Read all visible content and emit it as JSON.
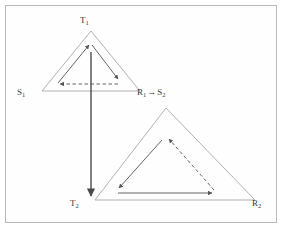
{
  "figure": {
    "type": "geometry-diagram",
    "background_color": "#ffffff",
    "frame_color": "#b9b9b9",
    "stroke_color": "#9a9a9a",
    "arrow_color": "#555555",
    "vertical_arrow_color": "#4a4a4a",
    "label_color": "#3a3a3a"
  },
  "labels": {
    "t1": "T",
    "t1_sub": "1",
    "s1": "S",
    "s1_sub": "1",
    "r1": "R",
    "r1_sub": "1",
    "map_arrow": "→",
    "s2": "S",
    "s2_sub": "2",
    "t2": "T",
    "t2_sub": "2",
    "r2": "R",
    "r2_sub": "2"
  },
  "triangles": [
    {
      "name": "triangle-one",
      "vertices": {
        "apex": {
          "label": "T1",
          "x": 91,
          "y": 31
        },
        "left": {
          "label": "S1",
          "x": 42,
          "y": 91
        },
        "right": {
          "label": "R1",
          "x": 140,
          "y": 91
        }
      },
      "inner_cycle": [
        {
          "style": "solid",
          "from": "left",
          "to": "apex",
          "direction": "up-right"
        },
        {
          "style": "solid",
          "from": "apex",
          "to": "right",
          "direction": "down-right"
        },
        {
          "style": "dashed",
          "from": "right",
          "to": "left",
          "direction": "left"
        }
      ]
    },
    {
      "name": "triangle-two",
      "vertices": {
        "apex": {
          "label": "S2",
          "x": 166,
          "y": 108
        },
        "left": {
          "label": "T2",
          "x": 95,
          "y": 200
        },
        "right": {
          "label": "R2",
          "x": 255,
          "y": 200
        }
      },
      "inner_cycle": [
        {
          "style": "solid",
          "from": "apex",
          "to": "left",
          "direction": "down-left"
        },
        {
          "style": "solid",
          "from": "left",
          "to": "right",
          "direction": "right"
        },
        {
          "style": "dashed",
          "from": "right",
          "to": "apex",
          "direction": "up-left"
        }
      ]
    }
  ],
  "connector": {
    "name": "t1-to-t2-arrow",
    "style": "solid",
    "direction": "down",
    "from": {
      "x": 91,
      "y": 52
    },
    "to": {
      "x": 91,
      "y": 197
    }
  }
}
